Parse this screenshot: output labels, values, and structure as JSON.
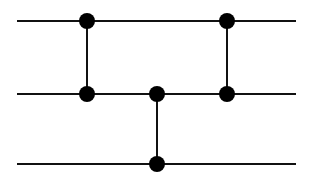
{
  "diagram": {
    "type": "network",
    "stroke_color": "#111111",
    "node_color": "#000000",
    "background": "#ffffff",
    "wires": [
      {
        "id": "wire-1",
        "y": 21,
        "x1": 17,
        "x2": 296
      },
      {
        "id": "wire-2",
        "y": 94,
        "x1": 17,
        "x2": 296
      },
      {
        "id": "wire-3",
        "y": 164,
        "x1": 17,
        "x2": 296
      }
    ],
    "connectors": [
      {
        "id": "connector-1",
        "x": 87,
        "y1": 21,
        "y2": 94
      },
      {
        "id": "connector-2",
        "x": 227,
        "y1": 21,
        "y2": 94
      },
      {
        "id": "connector-3",
        "x": 157,
        "y1": 94,
        "y2": 164
      }
    ],
    "nodes": [
      {
        "id": "node-1",
        "cx": 87,
        "cy": 21
      },
      {
        "id": "node-2",
        "cx": 227,
        "cy": 21
      },
      {
        "id": "node-3",
        "cx": 87,
        "cy": 94
      },
      {
        "id": "node-4",
        "cx": 157,
        "cy": 94
      },
      {
        "id": "node-5",
        "cx": 227,
        "cy": 94
      },
      {
        "id": "node-6",
        "cx": 157,
        "cy": 164
      }
    ],
    "node_radius": 8,
    "stroke_width": 2
  }
}
